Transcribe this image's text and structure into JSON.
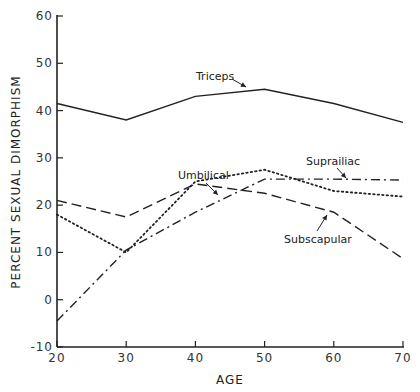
{
  "chart_data": {
    "type": "line",
    "title": "",
    "xlabel": "AGE",
    "ylabel": "PERCENT SEXUAL DIMORPHISM",
    "x": [
      20,
      30,
      40,
      50,
      60,
      70
    ],
    "xlim": [
      20,
      70
    ],
    "ylim": [
      -10,
      60
    ],
    "xticks": [
      "20",
      "30",
      "40",
      "50",
      "60",
      "70"
    ],
    "yticks": [
      "-10",
      "0",
      "10",
      "20",
      "30",
      "40",
      "50",
      "60"
    ],
    "grid": false,
    "legend": "inline labels with arrows",
    "series": [
      {
        "name": "Triceps",
        "style": "solid",
        "values": [
          41.5,
          38,
          43,
          44.5,
          41.5,
          37.5
        ]
      },
      {
        "name": "Subscapular",
        "style": "dashed",
        "values": [
          21,
          17.5,
          24.5,
          22.5,
          18.5,
          8.7
        ]
      },
      {
        "name": "Umbilical",
        "style": "dotted",
        "values": [
          18,
          10,
          25,
          27.5,
          23,
          21.8
        ]
      },
      {
        "name": "Suprailiac",
        "style": "dash-dot",
        "values": [
          -4.5,
          10.5,
          18.5,
          25.5,
          25.5,
          25.3
        ]
      }
    ]
  }
}
